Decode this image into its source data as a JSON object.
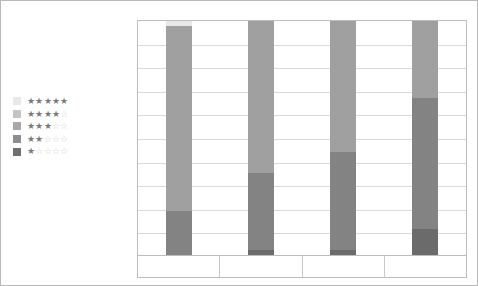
{
  "chart_data": {
    "type": "bar",
    "subtype": "100% stacked column",
    "title": "",
    "subtitle": "",
    "xlabel": "",
    "ylabel": "",
    "grid": true,
    "legend_position": "left",
    "ylim": [
      0,
      100
    ],
    "ytick_labels": [
      "100%",
      "90%",
      "80%",
      "70%",
      "60%",
      "50%",
      "40%",
      "30%",
      "20%",
      "10%"
    ],
    "ytick_values": [
      100,
      90,
      80,
      70,
      60,
      50,
      40,
      30,
      20,
      10
    ],
    "categories": [
      "0-10",
      "10-20 man-years",
      "20-50 man-years",
      ">50 man-years"
    ],
    "series": [
      {
        "name": "5 stars",
        "stars_filled": 5,
        "color": "#e8e8e8",
        "values": [
          2,
          0,
          0,
          0
        ]
      },
      {
        "name": "4 stars",
        "stars_filled": 4,
        "color": "#c4c4c4",
        "values": [
          0,
          0,
          0,
          0
        ]
      },
      {
        "name": "3 stars",
        "stars_filled": 3,
        "color": "#a0a0a0",
        "values": [
          79,
          65,
          56,
          33
        ]
      },
      {
        "name": "2 stars",
        "stars_filled": 2,
        "color": "#838383",
        "values": [
          19,
          33,
          42,
          56
        ]
      },
      {
        "name": "1 star",
        "stars_filled": 1,
        "color": "#6b6b6b",
        "values": [
          0,
          2,
          2,
          11
        ]
      }
    ],
    "segment_boundaries_pct": {
      "0-10": [
        98,
        19
      ],
      "10-20 man-years": [
        35,
        2
      ],
      "20-50 man-years": [
        44,
        2
      ],
      ">50 man-years": [
        67,
        11
      ]
    }
  },
  "legend": {
    "items": [
      {
        "label": "★★★★★",
        "filled": 5,
        "swatch": "#e8e8e8"
      },
      {
        "label": "★★★★☆",
        "filled": 4,
        "swatch": "#c4c4c4"
      },
      {
        "label": "★★★☆☆",
        "filled": 3,
        "swatch": "#a8a8a8"
      },
      {
        "label": "★★☆☆☆",
        "filled": 2,
        "swatch": "#8d8d8d"
      },
      {
        "label": "★☆☆☆☆",
        "filled": 1,
        "swatch": "#707070"
      }
    ]
  },
  "colors": {
    "frame_border": "#b9b9b9",
    "plot_border": "#bdbdbd",
    "gridline": "#d9d9d9",
    "axis_text": "#595959",
    "category_text": "#4a4a4a"
  }
}
